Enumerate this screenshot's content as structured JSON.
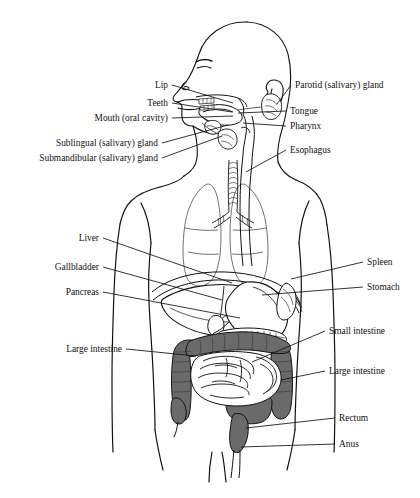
{
  "figure": {
    "view": "lateral-head-anterior-torso",
    "background_color": "#ffffff",
    "ink_color": "#111111",
    "shaded_organ_color": "#6a6a6a",
    "shaded_organ_name": "large-intestine"
  },
  "labels_left": [
    {
      "id": "lip",
      "text": "Lip",
      "x": 168,
      "y": 88,
      "lead_to_x": 233,
      "lead_to_y": 103
    },
    {
      "id": "teeth",
      "text": "Teeth",
      "x": 168,
      "y": 106,
      "lead_to_x": 232,
      "lead_to_y": 112
    },
    {
      "id": "mouth",
      "text": "Mouth (oral cavity)",
      "x": 168,
      "y": 121,
      "lead_to_x": 233,
      "lead_to_y": 116
    },
    {
      "id": "sublingual",
      "text": "Sublingual (salivary) gland",
      "x": 158,
      "y": 146,
      "lead_to_x": 228,
      "lead_to_y": 125
    },
    {
      "id": "submandibular",
      "text": "Submandibular (salivary) gland",
      "x": 158,
      "y": 161,
      "lead_to_x": 222,
      "lead_to_y": 136
    },
    {
      "id": "liver",
      "text": "Liver",
      "x": 99,
      "y": 241,
      "lead_to_x": 232,
      "lead_to_y": 283
    },
    {
      "id": "gallbladder",
      "text": "Gallbladder",
      "x": 99,
      "y": 270,
      "lead_to_x": 222,
      "lead_to_y": 300
    },
    {
      "id": "pancreas",
      "text": "Pancreas",
      "x": 99,
      "y": 295,
      "lead_to_x": 240,
      "lead_to_y": 318
    },
    {
      "id": "large-intestine-left",
      "text": "Large intestine",
      "x": 122,
      "y": 352,
      "lead_to_x": 196,
      "lead_to_y": 356
    }
  ],
  "labels_right": [
    {
      "id": "parotid",
      "text": "Parotid (salivary) gland",
      "x": 295,
      "y": 88,
      "lead_to_x": 277,
      "lead_to_y": 104
    },
    {
      "id": "tongue",
      "text": "Tongue",
      "x": 290,
      "y": 114,
      "lead_to_x": 238,
      "lead_to_y": 113
    },
    {
      "id": "pharynx",
      "text": "Pharynx",
      "x": 290,
      "y": 129,
      "lead_to_x": 243,
      "lead_to_y": 123
    },
    {
      "id": "esophagus",
      "text": "Esophagus",
      "x": 290,
      "y": 153,
      "lead_to_x": 246,
      "lead_to_y": 172
    },
    {
      "id": "spleen",
      "text": "Spleen",
      "x": 367,
      "y": 265,
      "lead_to_x": 291,
      "lead_to_y": 279
    },
    {
      "id": "stomach",
      "text": "Stomach",
      "x": 367,
      "y": 290,
      "lead_to_x": 262,
      "lead_to_y": 295
    },
    {
      "id": "small-intestine",
      "text": "Small intestine",
      "x": 329,
      "y": 334,
      "lead_to_x": 252,
      "lead_to_y": 362
    },
    {
      "id": "large-intestine-right",
      "text": "Large intestine",
      "x": 329,
      "y": 374,
      "lead_to_x": 281,
      "lead_to_y": 380
    },
    {
      "id": "rectum",
      "text": "Rectum",
      "x": 339,
      "y": 421,
      "lead_to_x": 246,
      "lead_to_y": 428
    },
    {
      "id": "anus",
      "text": "Anus",
      "x": 339,
      "y": 447,
      "lead_to_x": 241,
      "lead_to_y": 447
    }
  ]
}
